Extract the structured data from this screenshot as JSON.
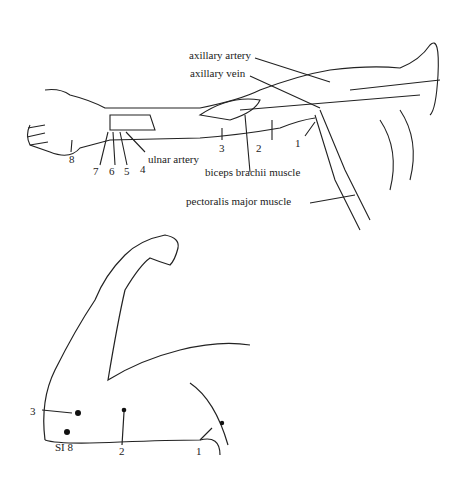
{
  "top_figure": {
    "labels": {
      "axillary_artery": "axillary artery",
      "axillary_vein": "axillary vein",
      "ulnar_artery": "ulnar artery",
      "biceps_brachii": "biceps brachii muscle",
      "pectoralis_major": "pectoralis major muscle"
    },
    "points": [
      "1",
      "2",
      "3",
      "4",
      "5",
      "6",
      "7",
      "8"
    ]
  },
  "bottom_figure": {
    "points": [
      "SI 8",
      "2",
      "1",
      "3"
    ]
  },
  "colors": {
    "ink": "#222222",
    "background": "#ffffff"
  }
}
